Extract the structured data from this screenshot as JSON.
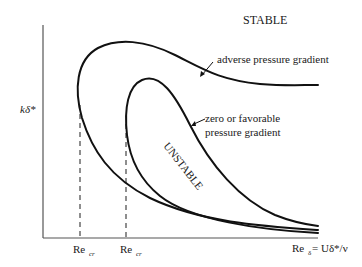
{
  "diagram": {
    "region_labels": {
      "stable": "STABLE",
      "unstable": "UNSTABLE"
    },
    "axes": {
      "ylabel": "kδ*",
      "xlabel_main": "Re",
      "xlabel_sub": "δ",
      "xlabel_rest": " = Uδ*/ν"
    },
    "critical_markers": [
      {
        "main": "Re",
        "sub": "cr"
      },
      {
        "main": "Re",
        "sub": "cr"
      }
    ],
    "curves": [
      {
        "label": "adverse pressure gradient"
      },
      {
        "label_line1": "zero or favorable",
        "label_line2": "pressure gradient"
      }
    ],
    "colors": {
      "curve": "#111111",
      "axis": "#555555",
      "text": "#1a1a1a"
    }
  }
}
